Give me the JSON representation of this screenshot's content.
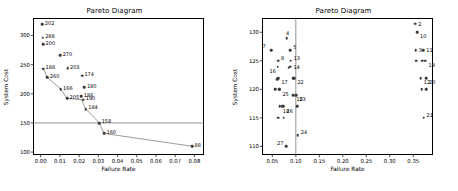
{
  "figure": {
    "panels": 2,
    "background_color": "#ffffff",
    "marker_color": "#3b3b3b",
    "line_color": "#555555",
    "axis_color": "#000000"
  },
  "chart_data": [
    {
      "type": "scatter",
      "title": "Pareto Diagram",
      "xlabel": "Failure Rate",
      "ylabel": "System Cost",
      "xlim": [
        -0.004,
        0.085
      ],
      "ylim": [
        95,
        330
      ],
      "xticks": [
        "0.00",
        "0.01",
        "0.02",
        "0.03",
        "0.04",
        "0.05",
        "0.06",
        "0.07",
        "0.08"
      ],
      "xtick_values": [
        0.0,
        0.01,
        0.02,
        0.03,
        0.04,
        0.05,
        0.06,
        0.07,
        0.08
      ],
      "yticks": [
        "100",
        "150",
        "200",
        "250",
        "300"
      ],
      "ytick_values": [
        100,
        150,
        200,
        250,
        300
      ],
      "grid": false,
      "legend": "none",
      "reference_line": {
        "orientation": "horizontal",
        "value": 150
      },
      "pareto_front_line": true,
      "points": [
        {
          "label": "202",
          "x": 0.0009,
          "y": 319
        },
        {
          "label": "288",
          "x": 0.0011,
          "y": 296
        },
        {
          "label": "200",
          "x": 0.0013,
          "y": 285
        },
        {
          "label": "270",
          "x": 0.0102,
          "y": 266
        },
        {
          "label": "188",
          "x": 0.0013,
          "y": 243
        },
        {
          "label": "203",
          "x": 0.014,
          "y": 244
        },
        {
          "label": "260",
          "x": 0.0035,
          "y": 228
        },
        {
          "label": "174",
          "x": 0.0215,
          "y": 231
        },
        {
          "label": "166",
          "x": 0.0104,
          "y": 208
        },
        {
          "label": "180",
          "x": 0.0228,
          "y": 211
        },
        {
          "label": "205",
          "x": 0.0138,
          "y": 192
        },
        {
          "label": "186",
          "x": 0.0212,
          "y": 196
        },
        {
          "label": "190",
          "x": 0.0222,
          "y": 190
        },
        {
          "label": "184",
          "x": 0.0235,
          "y": 174
        },
        {
          "label": "158",
          "x": 0.0305,
          "y": 150
        },
        {
          "label": "160",
          "x": 0.033,
          "y": 132
        },
        {
          "label": "88",
          "x": 0.0788,
          "y": 110
        }
      ],
      "front_path": [
        {
          "x": 0.0013,
          "y": 243
        },
        {
          "x": 0.0035,
          "y": 228
        },
        {
          "x": 0.0104,
          "y": 208
        },
        {
          "x": 0.0138,
          "y": 192
        },
        {
          "x": 0.0212,
          "y": 190
        },
        {
          "x": 0.0235,
          "y": 174
        },
        {
          "x": 0.0305,
          "y": 150
        },
        {
          "x": 0.033,
          "y": 132
        },
        {
          "x": 0.0788,
          "y": 110
        }
      ]
    },
    {
      "type": "scatter",
      "title": "Pareto Diagram",
      "xlabel": "Failure Rate",
      "ylabel": "System Cost",
      "xlim": [
        0.028,
        0.392
      ],
      "ylim": [
        108.5,
        132.5
      ],
      "xticks": [
        "0.05",
        "0.10",
        "0.15",
        "0.20",
        "0.25",
        "0.30",
        "0.35"
      ],
      "xtick_values": [
        0.05,
        0.1,
        0.15,
        0.2,
        0.25,
        0.3,
        0.35
      ],
      "yticks": [
        "110",
        "115",
        "120",
        "125",
        "130"
      ],
      "ytick_values": [
        110,
        115,
        120,
        125,
        130
      ],
      "grid": false,
      "legend": "none",
      "reference_line": {
        "orientation": "vertical",
        "value": 0.1
      },
      "pareto_front_line": false,
      "points": [
        {
          "label": "2",
          "x": 0.354,
          "y": 131.5,
          "lpos": "right"
        },
        {
          "label": "10",
          "x": 0.358,
          "y": 130.0,
          "lpos": "below-right"
        },
        {
          "label": "4",
          "x": 0.081,
          "y": 129.0,
          "lpos": "above"
        },
        {
          "label": "7",
          "x": 0.048,
          "y": 126.9,
          "lpos": "above-left"
        },
        {
          "label": "5",
          "x": 0.088,
          "y": 126.9,
          "lpos": "above-right"
        },
        {
          "label": "3",
          "x": 0.355,
          "y": 126.9,
          "lpos": "right"
        },
        {
          "label": "11",
          "x": 0.371,
          "y": 126.9,
          "lpos": "right"
        },
        {
          "label": "8",
          "x": 0.062,
          "y": 125.0,
          "lpos": "above-right"
        },
        {
          "label": "13",
          "x": 0.089,
          "y": 125.0,
          "lpos": "above-right"
        },
        {
          "label": "19",
          "x": 0.376,
          "y": 125.0,
          "lpos": "below-right"
        },
        {
          "label": "16",
          "x": 0.061,
          "y": 124.0,
          "lpos": "below-left"
        },
        {
          "label": "14",
          "x": 0.088,
          "y": 124.0,
          "lpos": "right"
        },
        {
          "label": "17",
          "x": 0.063,
          "y": 122.0,
          "lpos": "below-right"
        },
        {
          "label": "12",
          "x": 0.366,
          "y": 122.0,
          "lpos": "below-right"
        },
        {
          "label": "20",
          "x": 0.377,
          "y": 122.0,
          "lpos": "below-right"
        },
        {
          "label": "22",
          "x": 0.097,
          "y": 122.0,
          "lpos": "below-right"
        },
        {
          "label": "25",
          "x": 0.065,
          "y": 120.0,
          "lpos": "below-right"
        },
        {
          "label": "15",
          "x": 0.095,
          "y": 119.0,
          "lpos": "below-right"
        },
        {
          "label": "23",
          "x": 0.101,
          "y": 119.0,
          "lpos": "below-right"
        },
        {
          "label": "18",
          "x": 0.066,
          "y": 117.0,
          "lpos": "below-right"
        },
        {
          "label": "26",
          "x": 0.074,
          "y": 117.0,
          "lpos": "below-right"
        },
        {
          "label": "21",
          "x": 0.372,
          "y": 115.0,
          "lpos": "above-right"
        },
        {
          "label": "24",
          "x": 0.104,
          "y": 112.0,
          "lpos": "above-right"
        },
        {
          "label": "27",
          "x": 0.079,
          "y": 110.0,
          "lpos": "above-left"
        },
        {
          "label": "9",
          "x": 0.356,
          "y": 125.0,
          "lpos": "none"
        },
        {
          "label": "1",
          "x": 0.369,
          "y": 125.0,
          "lpos": "none"
        },
        {
          "label": "6",
          "x": 0.368,
          "y": 120.0,
          "lpos": "none"
        },
        {
          "label": "28",
          "x": 0.377,
          "y": 120.0,
          "lpos": "none"
        },
        {
          "label": "29",
          "x": 0.056,
          "y": 120.0,
          "lpos": "none"
        },
        {
          "label": "30",
          "x": 0.066,
          "y": 120.0,
          "lpos": "none"
        },
        {
          "label": "31",
          "x": 0.06,
          "y": 121.8,
          "lpos": "none"
        },
        {
          "label": "32",
          "x": 0.085,
          "y": 123.8,
          "lpos": "none"
        },
        {
          "label": "33",
          "x": 0.095,
          "y": 122.0,
          "lpos": "none"
        },
        {
          "label": "34",
          "x": 0.062,
          "y": 115.0,
          "lpos": "none"
        },
        {
          "label": "35",
          "x": 0.074,
          "y": 115.0,
          "lpos": "none"
        },
        {
          "label": "36",
          "x": 0.103,
          "y": 117.0,
          "lpos": "none"
        },
        {
          "label": "37",
          "x": 0.071,
          "y": 117.0,
          "lpos": "none"
        }
      ]
    }
  ]
}
